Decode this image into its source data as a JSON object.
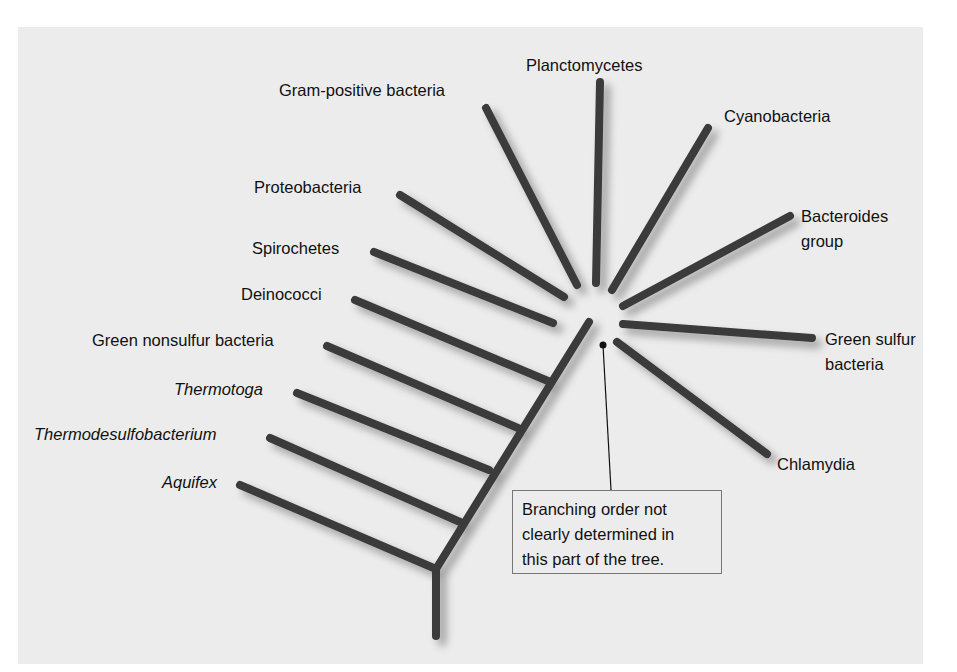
{
  "figure": {
    "type": "phylogenetic-tree",
    "subject": "Bacteria",
    "colors": {
      "background": "#ececec",
      "branch": "#3a3a3a",
      "text": "#111111",
      "callout_border": "#777777"
    }
  },
  "taxa": {
    "planctomycetes": "Planctomycetes",
    "gram_positive": "Gram-positive bacteria",
    "cyanobacteria": "Cyanobacteria",
    "proteobacteria": "Proteobacteria",
    "bacteroides_line1": "Bacteroides",
    "bacteroides_line2": "group",
    "spirochetes": "Spirochetes",
    "deinococci": "Deinococci",
    "green_sulfur_line1": "Green sulfur",
    "green_sulfur_line2": "bacteria",
    "green_nonsulfur": "Green nonsulfur bacteria",
    "thermotoga": "Thermotoga",
    "thermodesulfobacterium": "Thermodesulfobacterium",
    "chlamydia": "Chlamydia",
    "aquifex": "Aquifex"
  },
  "callout": {
    "line1": "Branching order not",
    "line2": "clearly determined in",
    "line3": "this part of the tree."
  }
}
